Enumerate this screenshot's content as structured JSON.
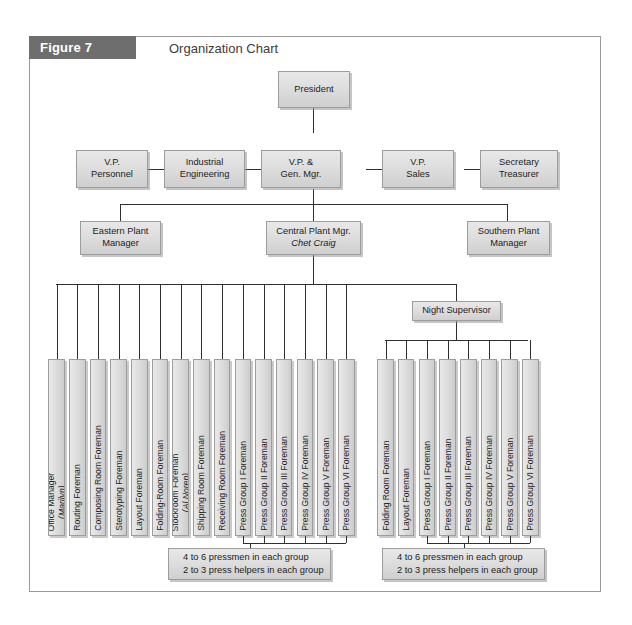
{
  "figure": {
    "number": "Figure 7",
    "title": "Organization Chart"
  },
  "nodes": {
    "president": "President",
    "vp_personnel": [
      "V.P.",
      "Personnel"
    ],
    "industrial_engineering": [
      "Industrial",
      "Engineering"
    ],
    "vp_gen_mgr": [
      "V.P. &",
      "Gen. Mgr."
    ],
    "vp_sales": [
      "V.P.",
      "Sales"
    ],
    "secretary_treasurer": [
      "Secretary",
      "Treasurer"
    ],
    "eastern_plant_manager": [
      "Eastern Plant",
      "Manager"
    ],
    "central_plant_manager": [
      "Central Plant Mgr.",
      "Chet Craig"
    ],
    "southern_plant_manager": [
      "Southern Plant",
      "Manager"
    ],
    "night_supervisor": "Night Supervisor"
  },
  "left_group": [
    {
      "label": "Office Manager",
      "name": "(Marilyn)"
    },
    {
      "label": "Routing Foreman"
    },
    {
      "label": "Composing Room Foreman"
    },
    {
      "label": "Sterotyping Foreman"
    },
    {
      "label": "Layout Foreman"
    },
    {
      "label": "Folding-Room Foreman"
    },
    {
      "label": "Stockroom Foreman",
      "name": "(Al Noren)"
    },
    {
      "label": "Shipping Room Foreman"
    },
    {
      "label": "Receiving Room Foreman"
    },
    {
      "label": "Press Group I Foreman"
    },
    {
      "label": "Press Group II Foreman"
    },
    {
      "label": "Press Group III Foreman"
    },
    {
      "label": "Press Group IV Foreman"
    },
    {
      "label": "Press Group V Foreman"
    },
    {
      "label": "Press Group VI Foreman"
    }
  ],
  "right_group": [
    {
      "label": "Folding Room Foreman"
    },
    {
      "label": "Layout Foreman"
    },
    {
      "label": "Press Group I Foreman"
    },
    {
      "label": "Press Group II Foreman"
    },
    {
      "label": "Press Group III Foreman"
    },
    {
      "label": "Press Group IV Foreman"
    },
    {
      "label": "Press Group V Foreman"
    },
    {
      "label": "Press Group VI Foreman"
    }
  ],
  "notes": {
    "left": [
      "4 to 6 pressmen in each group",
      "2 to 3 press helpers in each group"
    ],
    "right": [
      "4 to 6 pressmen in each group",
      "2 to 3 press helpers in each group"
    ]
  },
  "colors": {
    "header_band": "#6e6e6e",
    "frame_border": "#9a9a9a",
    "box_fill": "#dedede",
    "box_border": "#9d9d9d",
    "connector": "#2f2f2f",
    "text": "#1d1d1d"
  }
}
